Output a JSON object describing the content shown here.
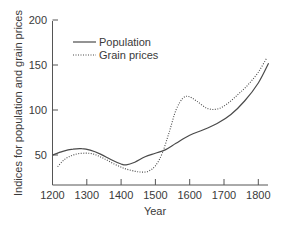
{
  "chart_data": {
    "type": "line",
    "title": "",
    "xlabel": "Year",
    "ylabel": "Indices for population and grain prices",
    "xlim": [
      1200,
      1845
    ],
    "ylim": [
      17,
      200
    ],
    "x_ticks": [
      1200,
      1300,
      1400,
      1500,
      1600,
      1700,
      1800
    ],
    "y_ticks": [
      50,
      100,
      150,
      200
    ],
    "grid": false,
    "legend_position": "upper left",
    "series": [
      {
        "name": "Population",
        "style": "solid",
        "x": [
          1200,
          1230,
          1260,
          1285,
          1310,
          1340,
          1370,
          1400,
          1415,
          1440,
          1470,
          1500,
          1530,
          1560,
          1600,
          1640,
          1680,
          1720,
          1760,
          1800,
          1830
        ],
        "y": [
          50,
          54,
          56.5,
          57,
          55.5,
          51,
          45,
          40,
          39,
          42,
          48,
          52,
          56,
          63,
          72,
          78,
          85,
          95,
          110,
          130,
          152
        ]
      },
      {
        "name": "Grain prices",
        "style": "dotted",
        "x": [
          1215,
          1235,
          1260,
          1290,
          1320,
          1350,
          1380,
          1410,
          1440,
          1460,
          1480,
          1500,
          1520,
          1540,
          1560,
          1580,
          1597,
          1620,
          1650,
          1680,
          1710,
          1740,
          1770,
          1800,
          1825
        ],
        "y": [
          37,
          45,
          50,
          52,
          51,
          46,
          40,
          35,
          32,
          31,
          32,
          38,
          52,
          75,
          100,
          113,
          115,
          110,
          102,
          101,
          107,
          117,
          128,
          142,
          158
        ]
      }
    ]
  },
  "axes": {
    "x_label": "Year",
    "y_label": "Indices for population and grain prices",
    "x_tick_labels": [
      "1200",
      "1300",
      "1400",
      "1500",
      "1600",
      "1700",
      "1800"
    ],
    "y_tick_labels": [
      "50",
      "100",
      "150",
      "200"
    ]
  },
  "legend": {
    "items": [
      {
        "label": "Population",
        "style": "solid"
      },
      {
        "label": "Grain prices",
        "style": "dotted"
      }
    ]
  },
  "colors": {
    "line": "#4a4a4a",
    "axis": "#555555",
    "text": "#3a3a3a"
  }
}
